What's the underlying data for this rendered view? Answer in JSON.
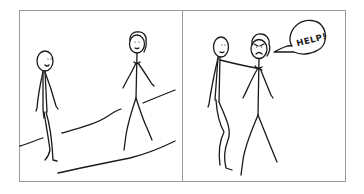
{
  "comic": {
    "panel_count": 2,
    "colors": {
      "ink": "#1a1a1a",
      "frame": "#9a9a9a",
      "background": "#ffffff"
    },
    "panels": [
      {
        "index": 1,
        "description": "Two stick figures walking along a path; one plain, one with curly hair",
        "figures": [
          "plain-stick-figure",
          "curly-haired-stick-figure"
        ]
      },
      {
        "index": 2,
        "description": "Plain stick figure grabs the curly-haired figure, who looks angry and shouts",
        "figures": [
          "plain-stick-figure",
          "angry-curly-haired-stick-figure"
        ],
        "speech_bubble": {
          "text": "HELP!"
        }
      }
    ]
  }
}
